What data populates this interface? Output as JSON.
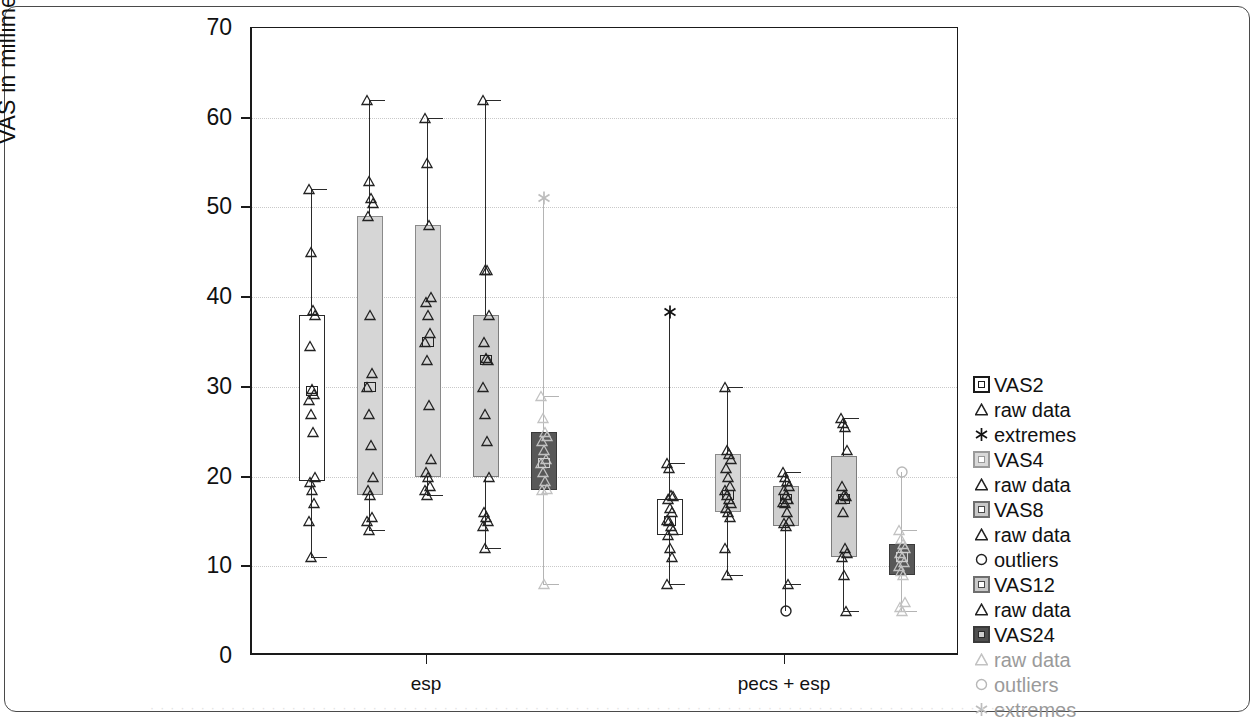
{
  "chart_data": {
    "type": "box",
    "title": "",
    "xlabel": "",
    "ylabel": "VAS in millimeters",
    "ylim": [
      0,
      70
    ],
    "yticks": [
      0,
      10,
      20,
      30,
      40,
      50,
      60,
      70
    ],
    "ytick_labels": [
      "0",
      "10",
      "20",
      "30",
      "40",
      "50",
      "60",
      "70"
    ],
    "grid": "horizontal-dotted",
    "categories": [
      "esp",
      "pecs + esp"
    ],
    "legend_position": "right",
    "series": [
      {
        "name": "VAS2",
        "fill": "#ffffff",
        "marker": "raw data"
      },
      {
        "name": "VAS4",
        "fill": "#d6d6d6",
        "marker": "raw data"
      },
      {
        "name": "VAS8",
        "fill": "#d6d6d6",
        "marker": "raw data"
      },
      {
        "name": "VAS12",
        "fill": "#cfcfcf",
        "marker": "raw data"
      },
      {
        "name": "VAS24",
        "fill": "#585858",
        "marker": "raw data"
      }
    ],
    "boxes": [
      {
        "group": "esp",
        "series": "VAS2",
        "style": "b-white",
        "cx": 310,
        "lower_whisker": 11,
        "q1": 19.5,
        "median": 29.5,
        "q3": 38,
        "upper_whisker": 52,
        "points": [
          52,
          45,
          38.6,
          38,
          34.5,
          29.8,
          29.2,
          28.5,
          27,
          25,
          20,
          19.4,
          18.5,
          17,
          15,
          11
        ],
        "outliers": [],
        "extremes": []
      },
      {
        "group": "esp",
        "series": "VAS4",
        "style": "b-light",
        "cx": 368,
        "lower_whisker": 14,
        "q1": 18,
        "median": 30,
        "q3": 49,
        "upper_whisker": 62,
        "points": [
          62,
          53,
          51,
          50.5,
          49,
          38,
          31.5,
          30,
          27,
          23.5,
          20,
          18.5,
          18,
          15.5,
          15,
          14
        ],
        "outliers": [],
        "extremes": []
      },
      {
        "group": "esp",
        "series": "VAS8",
        "style": "b-light",
        "cx": 426,
        "lower_whisker": 18,
        "q1": 20,
        "median": 35,
        "q3": 48,
        "upper_whisker": 60,
        "points": [
          60,
          55,
          48,
          40,
          39.5,
          38,
          36,
          35,
          33,
          28,
          22,
          20.5,
          20,
          19,
          18.5,
          18
        ],
        "outliers": [],
        "extremes": []
      },
      {
        "group": "esp",
        "series": "VAS12",
        "style": "b-mid",
        "cx": 484,
        "lower_whisker": 12,
        "q1": 20,
        "median": 33,
        "q3": 38,
        "upper_whisker": 62,
        "points": [
          62,
          43,
          43,
          38,
          35,
          33.2,
          33,
          30,
          27,
          24,
          20,
          16,
          15.5,
          15,
          14.5,
          12
        ],
        "outliers": [],
        "extremes": []
      },
      {
        "group": "esp",
        "series": "VAS24",
        "style": "b-dark",
        "cx": 542,
        "lower_whisker": 8,
        "q1": 18.5,
        "median": 21.5,
        "q3": 25,
        "upper_whisker": 29,
        "points": [
          29,
          26.5,
          25,
          24.5,
          24,
          23,
          22,
          21.5,
          20.5,
          19.5,
          18.6,
          18.5,
          8
        ],
        "outliers": [],
        "extremes": [
          51
        ]
      },
      {
        "group": "pecs + esp",
        "series": "VAS2",
        "style": "b-white",
        "cx": 668,
        "lower_whisker": 8,
        "q1": 13.5,
        "median": 15,
        "q3": 17.5,
        "upper_whisker": 21.5,
        "points": [
          21.5,
          21,
          18,
          17.8,
          17.5,
          16.5,
          16,
          15.2,
          15,
          14.5,
          14,
          13.5,
          12,
          11,
          8
        ],
        "outliers": [],
        "extremes": [
          38.3
        ]
      },
      {
        "group": "pecs + esp",
        "series": "VAS4",
        "style": "b-light",
        "cx": 726,
        "lower_whisker": 9,
        "q1": 16,
        "median": 18,
        "q3": 22.5,
        "upper_whisker": 30,
        "points": [
          30,
          23,
          22.5,
          22,
          21,
          20,
          19,
          18.5,
          18,
          17.5,
          17,
          16.5,
          16,
          15.5,
          12,
          9
        ],
        "outliers": [],
        "extremes": []
      },
      {
        "group": "pecs + esp",
        "series": "VAS8",
        "style": "b-mid",
        "cx": 784,
        "lower_whisker": 8,
        "q1": 14.5,
        "median": 17.5,
        "q3": 19,
        "upper_whisker": 20.5,
        "points": [
          20.5,
          20,
          19.5,
          19,
          18.5,
          18,
          17.5,
          17.2,
          17,
          16,
          15,
          14.8,
          14.5,
          8
        ],
        "outliers": [
          5
        ],
        "extremes": []
      },
      {
        "group": "pecs + esp",
        "series": "VAS12",
        "style": "b-mid",
        "cx": 842,
        "lower_whisker": 5,
        "q1": 11,
        "median": 17.5,
        "q3": 22.3,
        "upper_whisker": 26.5,
        "points": [
          26.5,
          26,
          25.5,
          23,
          19,
          18,
          17.8,
          17.5,
          16,
          12,
          11.5,
          11,
          9,
          5
        ],
        "outliers": [],
        "extremes": []
      },
      {
        "group": "pecs + esp",
        "series": "VAS24",
        "style": "b-dark",
        "cx": 900,
        "lower_whisker": 5,
        "q1": 9,
        "median": 11,
        "q3": 12.5,
        "upper_whisker": 14,
        "points": [
          14,
          13,
          12.5,
          12,
          11.5,
          11,
          10.5,
          10,
          9.5,
          9,
          6,
          5.5,
          5
        ],
        "outliers": [
          20.5
        ],
        "extremes": []
      }
    ]
  },
  "axis": {
    "y_title": "VAS in millimeters",
    "y_labels": [
      "70",
      "60",
      "50",
      "40",
      "30",
      "20",
      "10",
      "0"
    ],
    "x_labels": [
      "esp",
      "pecs + esp"
    ]
  },
  "legend": {
    "items": [
      {
        "symbol": "box-white",
        "label": "VAS2",
        "faint": false
      },
      {
        "symbol": "triangle",
        "label": "raw data",
        "faint": false
      },
      {
        "symbol": "asterisk",
        "label": "extremes",
        "faint": false
      },
      {
        "symbol": "box-light",
        "label": "VAS4",
        "faint": false
      },
      {
        "symbol": "triangle",
        "label": "raw data",
        "faint": false
      },
      {
        "symbol": "box-mid",
        "label": "VAS8",
        "faint": false
      },
      {
        "symbol": "triangle",
        "label": "raw data",
        "faint": false
      },
      {
        "symbol": "circle",
        "label": "outliers",
        "faint": false
      },
      {
        "symbol": "box-mid",
        "label": "VAS12",
        "faint": false
      },
      {
        "symbol": "triangle",
        "label": "raw data",
        "faint": false
      },
      {
        "symbol": "box-dark",
        "label": "VAS24",
        "faint": false
      },
      {
        "symbol": "triangle",
        "label": "raw data",
        "faint": true
      },
      {
        "symbol": "circle",
        "label": "outliers",
        "faint": true
      },
      {
        "symbol": "asterisk",
        "label": "extremes",
        "faint": true
      }
    ]
  },
  "caption": {
    "text": "· · · · · · · · · · · · · · · · · · · · · · · · · · · · · · · · · · · · · · · · · · · · · · · · · · · · · · · · · · · · · · · · · · · · · · · · · · · · · · · · · · · · · · · ·"
  }
}
